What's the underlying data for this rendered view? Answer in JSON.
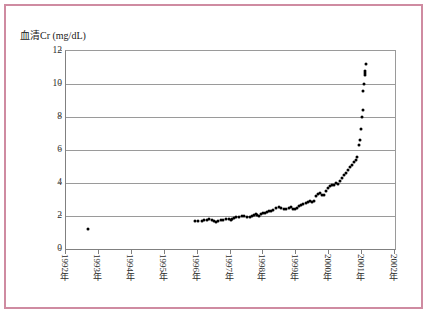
{
  "figure": {
    "border_color": "#cf8ba1",
    "background_color": "#ffffff"
  },
  "chart_data": {
    "type": "scatter",
    "title": "血清Cr (mg/dL)",
    "xlabel": "",
    "ylabel": "",
    "ylim": [
      0,
      12
    ],
    "xlim": [
      1992,
      2002
    ],
    "yticks": [
      0,
      2,
      4,
      6,
      8,
      10,
      12
    ],
    "ytick_labels": [
      "0",
      "2",
      "4",
      "6",
      "8",
      "10",
      "12"
    ],
    "xtick_labels": [
      "1992年",
      "1993年",
      "1994年",
      "1995年",
      "1996年",
      "1997年",
      "1998年",
      "1999年",
      "2000年",
      "2001年",
      "2002年"
    ],
    "xticks": [
      1992,
      1993,
      1994,
      1995,
      1996,
      1997,
      1998,
      1999,
      2000,
      2001,
      2002
    ],
    "grid": "horizontal",
    "legend": "none",
    "marker_color": "#000000",
    "gridline_color": "#9a9a9a",
    "series": [
      {
        "name": "血清Cr",
        "x": [
          1992.68,
          1995.92,
          1996.02,
          1996.12,
          1996.2,
          1996.28,
          1996.36,
          1996.44,
          1996.5,
          1996.56,
          1996.62,
          1996.7,
          1996.78,
          1996.86,
          1996.94,
          1997.0,
          1997.06,
          1997.12,
          1997.18,
          1997.26,
          1997.34,
          1997.42,
          1997.5,
          1997.58,
          1997.64,
          1997.7,
          1997.76,
          1997.82,
          1997.88,
          1997.94,
          1998.0,
          1998.06,
          1998.12,
          1998.18,
          1998.24,
          1998.3,
          1998.38,
          1998.46,
          1998.54,
          1998.62,
          1998.7,
          1998.78,
          1998.84,
          1998.9,
          1998.96,
          1999.02,
          1999.08,
          1999.14,
          1999.2,
          1999.28,
          1999.36,
          1999.42,
          1999.48,
          1999.54,
          1999.6,
          1999.66,
          1999.72,
          1999.78,
          1999.84,
          1999.9,
          1999.96,
          2000.02,
          2000.08,
          2000.14,
          2000.2,
          2000.26,
          2000.32,
          2000.38,
          2000.44,
          2000.5,
          2000.56,
          2000.62,
          2000.68,
          2000.74,
          2000.8,
          2000.86,
          2000.9,
          2000.94,
          2000.97,
          2001.0,
          2001.02,
          2001.04
        ],
        "y": [
          1.2,
          1.72,
          1.7,
          1.71,
          1.75,
          1.78,
          1.8,
          1.76,
          1.7,
          1.62,
          1.68,
          1.74,
          1.78,
          1.8,
          1.82,
          1.78,
          1.84,
          1.88,
          1.92,
          1.95,
          1.98,
          2.0,
          1.95,
          1.92,
          2.0,
          2.06,
          2.1,
          2.05,
          2.02,
          2.1,
          2.16,
          2.2,
          2.26,
          2.32,
          2.3,
          2.38,
          2.46,
          2.52,
          2.48,
          2.44,
          2.4,
          2.46,
          2.52,
          2.44,
          2.4,
          2.5,
          2.58,
          2.64,
          2.7,
          2.76,
          2.82,
          2.9,
          2.86,
          2.92,
          3.2,
          3.34,
          3.4,
          3.3,
          3.26,
          3.5,
          3.7,
          3.82,
          3.9,
          3.88,
          4.0,
          3.96,
          4.1,
          4.3,
          4.5,
          4.6,
          4.8,
          5.0,
          5.1,
          5.3,
          5.4,
          5.6,
          6.3,
          6.6,
          7.3,
          8.0,
          8.4,
          9.6
        ]
      },
      {
        "name": "血清Cr (末期)",
        "x": [
          2001.06,
          2001.08,
          2001.09,
          2001.1,
          2001.11
        ],
        "y": [
          10.0,
          10.55,
          10.65,
          10.78,
          11.2
        ]
      }
    ]
  }
}
